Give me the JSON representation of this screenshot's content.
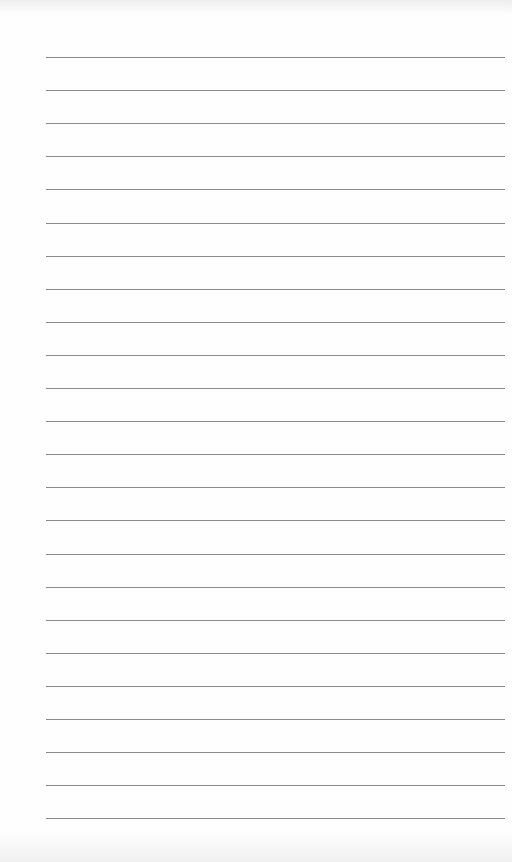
{
  "page": {
    "type": "lined-paper",
    "line_count": 24,
    "first_line_y": 57,
    "line_spacing": 33.1,
    "line_left": 46,
    "line_width": 459,
    "line_color": "#8a8a8a",
    "background": "#fefefe"
  }
}
